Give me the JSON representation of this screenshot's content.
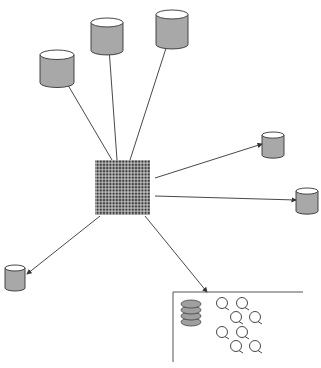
{
  "diagram": {
    "title": "",
    "colors": {
      "cylinder_body": "#a8a8a8",
      "cylinder_top": "#ffffff",
      "stroke": "#333333",
      "hub": "#555555",
      "ellipse_stack": "#a0a0a0"
    },
    "hub": {
      "label": "",
      "x": 95,
      "y": 160,
      "w": 55,
      "h": 55,
      "shape": "dense-grid-of-small-circles"
    },
    "cylinders": [
      {
        "id": "db-1",
        "cx": 57,
        "top": 50,
        "w": 34,
        "h": 28
      },
      {
        "id": "db-2",
        "cx": 107,
        "top": 18,
        "w": 32,
        "h": 28
      },
      {
        "id": "db-3",
        "cx": 172,
        "top": 10,
        "w": 32,
        "h": 30
      },
      {
        "id": "db-4",
        "cx": 273,
        "top": 132,
        "w": 22,
        "h": 20
      },
      {
        "id": "db-5",
        "cx": 307,
        "top": 188,
        "w": 22,
        "h": 20
      },
      {
        "id": "db-6",
        "cx": 15,
        "top": 265,
        "w": 20,
        "h": 20
      }
    ],
    "arrows": [
      {
        "from": [
          112,
          160
        ],
        "to": [
          65,
          80
        ]
      },
      {
        "from": [
          117,
          160
        ],
        "to": [
          109,
          48
        ]
      },
      {
        "from": [
          130,
          160
        ],
        "to": [
          168,
          42
        ]
      },
      {
        "from": [
          155,
          178
        ],
        "to": [
          262,
          144
        ]
      },
      {
        "from": [
          155,
          196
        ],
        "to": [
          296,
          200
        ]
      },
      {
        "from": [
          100,
          216
        ],
        "to": [
          27,
          274
        ]
      },
      {
        "from": [
          145,
          216
        ],
        "to": [
          207,
          292
        ]
      }
    ],
    "panel": {
      "x": 173,
      "y": 292,
      "w": 130,
      "h": 70,
      "stack_ellipses": 4,
      "loops": [
        [
          222,
          303
        ],
        [
          242,
          303
        ],
        [
          236,
          317
        ],
        [
          255,
          317
        ],
        [
          222,
          332
        ],
        [
          242,
          332
        ],
        [
          236,
          346
        ],
        [
          255,
          346
        ]
      ]
    }
  }
}
